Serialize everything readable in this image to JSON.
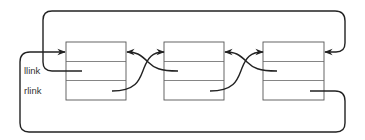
{
  "diagram": {
    "type": "circular-doubly-linked-list",
    "labels": {
      "llink": "llink",
      "rlink": "rlink"
    },
    "nodes": [
      {
        "id": "node-1",
        "fields": [
          "header",
          "llink",
          "rlink"
        ]
      },
      {
        "id": "node-2",
        "fields": [
          "header",
          "llink",
          "rlink"
        ]
      },
      {
        "id": "node-3",
        "fields": [
          "header",
          "llink",
          "rlink"
        ]
      }
    ],
    "edges": [
      {
        "from": "node-1.rlink",
        "to": "node-2",
        "kind": "rlink"
      },
      {
        "from": "node-2.llink",
        "to": "node-1",
        "kind": "llink"
      },
      {
        "from": "node-2.rlink",
        "to": "node-3",
        "kind": "rlink"
      },
      {
        "from": "node-3.llink",
        "to": "node-2",
        "kind": "llink"
      },
      {
        "from": "node-1.llink",
        "to": "node-3",
        "kind": "llink",
        "route": "top-loop"
      },
      {
        "from": "node-3.rlink",
        "to": "node-1",
        "kind": "rlink",
        "route": "bottom-loop"
      }
    ],
    "colors": {
      "line": "#222222",
      "box": "#555555",
      "background": "#ffffff"
    }
  }
}
